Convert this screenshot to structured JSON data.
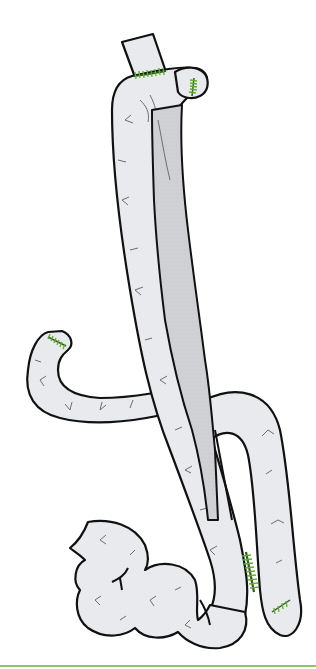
{
  "figure": {
    "description": "Anatomical illustration of surgically reconstructed bowel loops with staple lines",
    "colors": {
      "background": "#ffffff",
      "bowel_fill": "#e9ebee",
      "inner_limb_fill": "#cfd1d5",
      "outline": "#111111",
      "vessel": "#6b6e73",
      "staple": "#5fae2e",
      "staple_dark": "#2f5f1a",
      "bottom_rule": "#8cc665"
    },
    "parts": [
      {
        "id": "proximal-stump",
        "label": "Proximal stump"
      },
      {
        "id": "upper-anastomosis",
        "label": "Upper anastomosis (staple line)"
      },
      {
        "id": "blind-end-top",
        "label": "Blind end with staple line"
      },
      {
        "id": "long-limb",
        "label": "Long ascending limb"
      },
      {
        "id": "inner-limb",
        "label": "Inner limb (shaded)"
      },
      {
        "id": "side-loop",
        "label": "Curved side loop with stapled end"
      },
      {
        "id": "crossing-loop",
        "label": "Crossing loop"
      },
      {
        "id": "distal-bowel",
        "label": "Distal coiled bowel"
      },
      {
        "id": "lower-anastomosis",
        "label": "Lower side anastomosis (staple line)"
      },
      {
        "id": "blind-end-bottom",
        "label": "Lower blind end with staple line"
      }
    ]
  }
}
